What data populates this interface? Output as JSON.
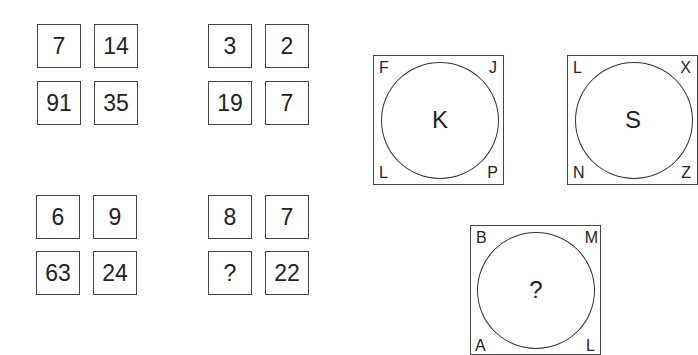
{
  "number_grids": [
    {
      "id": "top-left",
      "cells": [
        "7",
        "14",
        "91",
        "35"
      ]
    },
    {
      "id": "top-right",
      "cells": [
        "3",
        "2",
        "19",
        "7"
      ]
    },
    {
      "id": "bottom-left",
      "cells": [
        "6",
        "9",
        "63",
        "24"
      ]
    },
    {
      "id": "bottom-right",
      "cells": [
        "8",
        "7",
        "?",
        "22"
      ]
    }
  ],
  "circle_puzzles": [
    {
      "id": "k",
      "center": "K",
      "top_left": "F",
      "top_right": "J",
      "bottom_left": "L",
      "bottom_right": "P"
    },
    {
      "id": "s",
      "center": "S",
      "top_left": "L",
      "top_right": "X",
      "bottom_left": "N",
      "bottom_right": "Z"
    },
    {
      "id": "unknown",
      "center": "?",
      "top_left": "B",
      "top_right": "M",
      "bottom_left": "A",
      "bottom_right": "L"
    }
  ]
}
